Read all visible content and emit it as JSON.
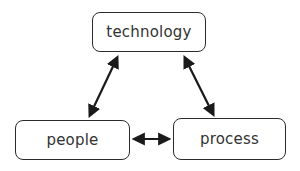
{
  "diagram": {
    "type": "cycle",
    "nodes": [
      {
        "id": "technology",
        "label": "technology"
      },
      {
        "id": "people",
        "label": "people"
      },
      {
        "id": "process",
        "label": "process"
      }
    ],
    "edges": [
      {
        "from": "technology",
        "to": "people",
        "direction": "bidirectional"
      },
      {
        "from": "technology",
        "to": "process",
        "direction": "bidirectional"
      },
      {
        "from": "people",
        "to": "process",
        "direction": "bidirectional"
      }
    ],
    "colors": {
      "stroke": "#1a1a1a",
      "border": "#2b2b2b",
      "text": "#333333",
      "background": "#ffffff"
    }
  }
}
